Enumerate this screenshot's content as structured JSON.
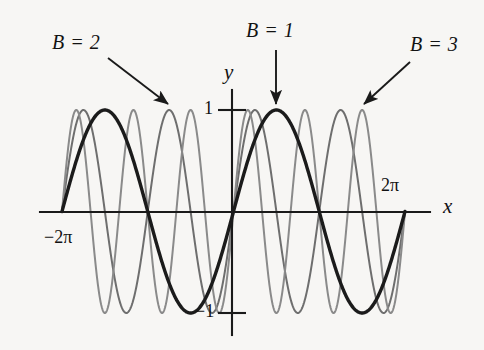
{
  "figure": {
    "background_color": "#f7f6f4",
    "width": 484,
    "height": 350
  },
  "axes": {
    "x_axis_label": "x",
    "y_axis_label": "y",
    "x_tick_labels": [
      "−2π",
      "2π"
    ],
    "y_tick_labels": [
      "1",
      "−1"
    ],
    "x_axis_pixel_y": 212,
    "y_axis_pixel_x": 232,
    "x_axis_pixel_start": 40,
    "x_axis_pixel_end": 430,
    "y_axis_pixel_top": 90,
    "y_axis_pixel_bottom": 335,
    "axis_color": "#1a1a1a"
  },
  "annotations": [
    {
      "name": "label-b2",
      "text": "B = 2",
      "arrow": {
        "x1": 108,
        "y1": 58,
        "x2": 168,
        "y2": 104
      }
    },
    {
      "name": "label-b1",
      "text": "B = 1",
      "arrow": {
        "x1": 276,
        "y1": 50,
        "x2": 276,
        "y2": 104
      }
    },
    {
      "name": "label-b3",
      "text": "B = 3",
      "arrow": {
        "x1": 410,
        "y1": 62,
        "x2": 364,
        "y2": 104
      }
    }
  ],
  "chart_data": {
    "type": "line",
    "title": "",
    "xlabel": "x",
    "ylabel": "y",
    "xlim": [
      -6.283185307179586,
      6.283185307179586
    ],
    "ylim": [
      -1,
      1
    ],
    "xticks": [
      -6.283185307179586,
      6.283185307179586
    ],
    "xticklabels": [
      "−2π",
      "2π"
    ],
    "yticks": [
      1,
      -1
    ],
    "yticklabels": [
      "1",
      "−1"
    ],
    "grid": false,
    "legend": "annotated-arrows",
    "function_form": "y = sin(Bx)",
    "series": [
      {
        "name": "B = 1",
        "B": 1,
        "amplitude": 1,
        "period": 6.283185307179586,
        "color": "#1b1b1b",
        "line_width": 3.4,
        "emphasis": "bold"
      },
      {
        "name": "B = 2",
        "B": 2,
        "amplitude": 1,
        "period": 3.141592653589793,
        "color": "#6e6e6e",
        "line_width": 2.0,
        "emphasis": "light"
      },
      {
        "name": "B = 3",
        "B": 3,
        "amplitude": 1,
        "period": 2.0943951023931953,
        "color": "#8a8a8a",
        "line_width": 2.0,
        "emphasis": "light"
      }
    ]
  }
}
